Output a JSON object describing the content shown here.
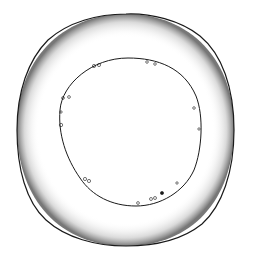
{
  "illustration": {
    "subject": "ring-shaped specimen drawing (stippled outer band, thin inner contour with small vesicles)",
    "colors": {
      "background": "#ffffff",
      "ink": "#1a1a1a"
    },
    "outer_contour": {
      "cx": 126,
      "cy": 130,
      "rx": 108,
      "ry": 116
    },
    "inner_contour": {
      "cx": 130,
      "cy": 132,
      "rx": 72,
      "ry": 74
    }
  }
}
